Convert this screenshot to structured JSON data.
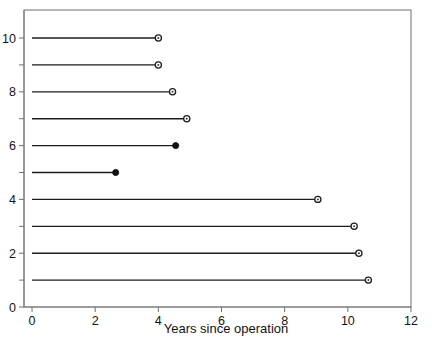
{
  "chart_data": {
    "type": "scatter",
    "title": "",
    "subtitle": "",
    "xlabel": "Years since operation",
    "ylabel": "",
    "xlim": [
      0,
      12
    ],
    "ylim": [
      0,
      11
    ],
    "grid": false,
    "legend": null,
    "xticks": [
      0,
      2,
      4,
      6,
      8,
      10,
      12
    ],
    "xtick_labels": [
      "0",
      "2",
      "4",
      "6",
      "8",
      "10",
      "12"
    ],
    "yticks": [
      0,
      1,
      2,
      3,
      4,
      5,
      6,
      7,
      8,
      9,
      10
    ],
    "ytick_labels_shown": [
      "0",
      "2",
      "4",
      "6",
      "8",
      "10"
    ],
    "ytick_labels_map": {
      "0": "0",
      "2": "2",
      "4": "4",
      "6": "6",
      "8": "8",
      "10": "10"
    },
    "marker_types": {
      "open": "censored",
      "closed": "event"
    },
    "series": [
      {
        "name": "subject-10",
        "y": 10,
        "x_start": 0,
        "x_end": 4.0,
        "marker": "open"
      },
      {
        "name": "subject-9",
        "y": 9,
        "x_start": 0,
        "x_end": 4.0,
        "marker": "open"
      },
      {
        "name": "subject-8",
        "y": 8,
        "x_start": 0,
        "x_end": 4.45,
        "marker": "open"
      },
      {
        "name": "subject-7",
        "y": 7,
        "x_start": 0,
        "x_end": 4.9,
        "marker": "open"
      },
      {
        "name": "subject-6",
        "y": 6,
        "x_start": 0,
        "x_end": 4.55,
        "marker": "closed"
      },
      {
        "name": "subject-5",
        "y": 5,
        "x_start": 0,
        "x_end": 2.65,
        "marker": "closed"
      },
      {
        "name": "subject-4",
        "y": 4,
        "x_start": 0,
        "x_end": 9.05,
        "marker": "open"
      },
      {
        "name": "subject-3",
        "y": 3,
        "x_start": 0,
        "x_end": 10.2,
        "marker": "open"
      },
      {
        "name": "subject-2",
        "y": 2,
        "x_start": 0,
        "x_end": 10.35,
        "marker": "open"
      },
      {
        "name": "subject-1",
        "y": 1,
        "x_start": 0,
        "x_end": 10.65,
        "marker": "open"
      }
    ]
  },
  "colors": {
    "background": "#ffffff",
    "frame": "#6e6e6e",
    "axis": "#808080",
    "data_line": "#1d1d1d",
    "marker_fill_open": "#ffffff",
    "marker_fill_closed": "#111111",
    "text": "#141414"
  },
  "geometry": {
    "width": 432,
    "height": 344,
    "plot_left": 24,
    "plot_right": 411,
    "plot_top": 10,
    "plot_bottom": 307,
    "x_origin_px": 32,
    "x_px_per_unit": 31.583,
    "y_origin_px": 307,
    "y_px_per_unit": 26.9
  }
}
